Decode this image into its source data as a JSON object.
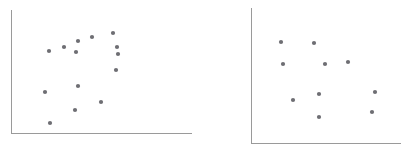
{
  "figure": {
    "title": "",
    "background_color": "#ffffff",
    "panel_count": 2
  },
  "style": {
    "point_color": "#6e6e73",
    "axis_color": "#9a9a9a",
    "point_radius": 2.1,
    "axis_width": 1
  },
  "chart_data": [
    {
      "type": "scatter",
      "title": "",
      "subtitle": "",
      "xlabel": "",
      "ylabel": "",
      "panel": "left",
      "grid": false,
      "legend": false,
      "xlim": [
        0,
        200
      ],
      "ylim": [
        0,
        151
      ],
      "axes": {
        "y_axis_x": 11,
        "y_axis_top": 10,
        "y_axis_bottom": 133,
        "x_axis_y": 133,
        "x_axis_left": 11,
        "x_axis_right": 192
      },
      "n_points": 14,
      "points": [
        {
          "x": 113,
          "y": 33
        },
        {
          "x": 92,
          "y": 37
        },
        {
          "x": 78,
          "y": 41
        },
        {
          "x": 64,
          "y": 47
        },
        {
          "x": 117,
          "y": 47
        },
        {
          "x": 49,
          "y": 51
        },
        {
          "x": 76,
          "y": 52
        },
        {
          "x": 118,
          "y": 54
        },
        {
          "x": 116,
          "y": 70
        },
        {
          "x": 78,
          "y": 86
        },
        {
          "x": 45,
          "y": 92
        },
        {
          "x": 101,
          "y": 102
        },
        {
          "x": 75,
          "y": 110
        },
        {
          "x": 50,
          "y": 123
        }
      ]
    },
    {
      "type": "scatter",
      "title": "",
      "subtitle": "",
      "xlabel": "",
      "ylabel": "",
      "panel": "right",
      "grid": false,
      "legend": false,
      "xlim": [
        0,
        201
      ],
      "ylim": [
        0,
        151
      ],
      "axes": {
        "y_axis_x": 51,
        "y_axis_top": 8,
        "y_axis_bottom": 143,
        "x_axis_y": 143,
        "x_axis_left": 51,
        "x_axis_right": 201
      },
      "n_points": 10,
      "points": [
        {
          "x": 81,
          "y": 42
        },
        {
          "x": 114,
          "y": 43
        },
        {
          "x": 148,
          "y": 62
        },
        {
          "x": 83,
          "y": 64
        },
        {
          "x": 125,
          "y": 64
        },
        {
          "x": 175,
          "y": 92
        },
        {
          "x": 119,
          "y": 94
        },
        {
          "x": 93,
          "y": 100
        },
        {
          "x": 172,
          "y": 112
        },
        {
          "x": 119,
          "y": 117
        }
      ]
    }
  ]
}
